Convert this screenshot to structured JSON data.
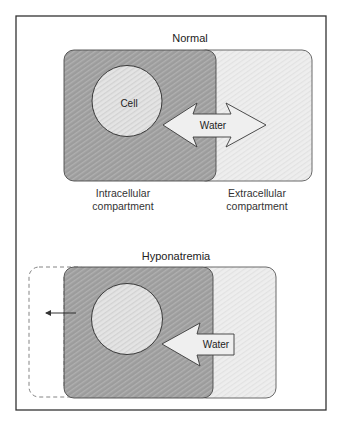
{
  "figure": {
    "colors": {
      "frame": "#333333",
      "intracellular_fill": "#9c9c9c",
      "extracellular_fill": "#ececec",
      "cell_fill": "#e2e2e2",
      "arrow_fill": "#eeeeee",
      "outline": "#4a4a4a"
    },
    "normal": {
      "title": "Normal",
      "cell_label": "Cell",
      "arrow_label": "Water",
      "arrow_direction": "bidirectional",
      "intracellular_line1": "Intracellular",
      "intracellular_line2": "compartment",
      "extracellular_line1": "Extracellular",
      "extracellular_line2": "compartment"
    },
    "hyponatremia": {
      "title": "Hyponatremia",
      "arrow_label": "Water",
      "arrow_direction": "into cell",
      "expansion_indicator": "dashed outline with leftward arrow"
    }
  }
}
